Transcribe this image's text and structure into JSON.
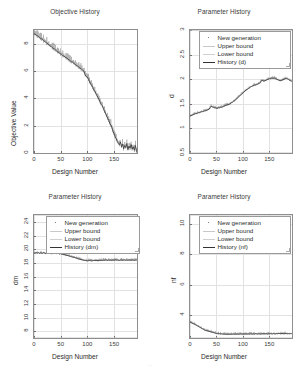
{
  "figure": {
    "width": 299,
    "height": 369,
    "background": "#ffffff",
    "footer_mark": ".."
  },
  "legend_common": {
    "new_generation": "New generation",
    "upper_bound": "Upper bound",
    "lower_bound": "Lower bound"
  },
  "colors": {
    "history_line": "#333333",
    "bound_line": "#c8c8c8",
    "marker": "#555555",
    "grid": "#e2e2e2",
    "axis": "#8e8e8e",
    "text": "#2b2b2b"
  },
  "chart_data": [
    {
      "id": "objective-history",
      "type": "line",
      "title": "Objective History",
      "xlabel": "Design Number",
      "ylabel": "Objective Value",
      "xlim": [
        0,
        193
      ],
      "ylim": [
        0,
        9
      ],
      "xticks": [
        0,
        50,
        100,
        150
      ],
      "yticks": [
        0,
        2,
        4,
        6,
        8
      ],
      "grid": true,
      "legend": null,
      "series": [
        {
          "name": "Objective Value",
          "x": [
            0,
            2,
            4,
            6,
            8,
            10,
            12,
            14,
            16,
            18,
            20,
            22,
            24,
            26,
            28,
            30,
            32,
            34,
            36,
            38,
            40,
            42,
            44,
            46,
            48,
            50,
            52,
            54,
            56,
            58,
            60,
            62,
            64,
            66,
            68,
            70,
            72,
            74,
            76,
            78,
            80,
            82,
            84,
            86,
            88,
            90,
            92,
            94,
            96,
            98,
            100,
            102,
            104,
            106,
            108,
            110,
            112,
            114,
            116,
            118,
            120,
            122,
            124,
            126,
            128,
            130,
            132,
            134,
            136,
            138,
            140,
            142,
            144,
            146,
            148,
            150,
            152,
            154,
            156,
            158,
            160,
            162,
            164,
            166,
            168,
            170,
            172,
            174,
            176,
            178,
            180,
            182,
            184,
            186,
            188,
            190,
            192
          ],
          "values": [
            8.72,
            8.7,
            8.64,
            8.58,
            8.55,
            8.46,
            8.4,
            8.36,
            8.3,
            8.22,
            8.18,
            8.1,
            8.05,
            7.98,
            7.92,
            7.84,
            7.8,
            7.72,
            7.66,
            7.62,
            7.55,
            7.48,
            7.4,
            7.38,
            7.3,
            7.25,
            7.2,
            7.12,
            7.1,
            7.02,
            6.98,
            6.94,
            6.88,
            6.8,
            6.74,
            6.68,
            6.65,
            6.58,
            6.52,
            6.46,
            6.4,
            6.34,
            6.28,
            6.22,
            6.18,
            6.1,
            6.02,
            5.95,
            5.7,
            5.6,
            5.55,
            5.4,
            5.22,
            5.05,
            4.98,
            4.8,
            4.62,
            4.52,
            4.35,
            4.2,
            4.05,
            3.9,
            3.72,
            3.55,
            3.45,
            3.25,
            3.05,
            2.92,
            2.7,
            2.55,
            2.38,
            2.18,
            2.05,
            1.85,
            1.6,
            1.4,
            1.2,
            1.05,
            0.85,
            0.7,
            0.6,
            0.8,
            0.45,
            0.65,
            0.3,
            0.55,
            0.4,
            0.7,
            0.25,
            0.5,
            0.35,
            0.62,
            0.28,
            0.45,
            0.2,
            0.55,
            0.1
          ]
        }
      ]
    },
    {
      "id": "parameter-history-d",
      "type": "line",
      "title": "Parameter History",
      "xlabel": "Design Number",
      "ylabel": "d",
      "xlim": [
        0,
        193
      ],
      "ylim": [
        0.5,
        3
      ],
      "xticks": [
        0,
        50,
        100,
        150
      ],
      "yticks": [
        0.5,
        1,
        1.5,
        2,
        2.5,
        3
      ],
      "grid": true,
      "legend": {
        "position": "top-right",
        "entries": [
          "New generation",
          "Upper bound",
          "Lower bound",
          "History (d)"
        ]
      },
      "series": [
        {
          "name": "History (d)",
          "x": [
            0,
            2,
            4,
            6,
            8,
            10,
            12,
            14,
            16,
            18,
            20,
            22,
            24,
            26,
            28,
            30,
            32,
            34,
            36,
            38,
            40,
            42,
            44,
            46,
            48,
            50,
            52,
            54,
            56,
            58,
            60,
            62,
            64,
            66,
            68,
            70,
            72,
            74,
            76,
            78,
            80,
            82,
            84,
            86,
            88,
            90,
            92,
            94,
            96,
            98,
            100,
            102,
            104,
            106,
            108,
            110,
            112,
            114,
            116,
            118,
            120,
            122,
            124,
            126,
            128,
            130,
            132,
            134,
            136,
            138,
            140,
            142,
            144,
            146,
            148,
            150,
            152,
            154,
            156,
            158,
            160,
            162,
            164,
            166,
            168,
            170,
            172,
            174,
            176,
            178,
            180,
            182,
            184,
            186,
            188,
            190,
            192
          ],
          "values": [
            1.25,
            1.26,
            1.27,
            1.28,
            1.29,
            1.3,
            1.3,
            1.31,
            1.32,
            1.32,
            1.33,
            1.34,
            1.34,
            1.35,
            1.36,
            1.36,
            1.37,
            1.38,
            1.39,
            1.42,
            1.45,
            1.44,
            1.43,
            1.42,
            1.42,
            1.41,
            1.41,
            1.42,
            1.42,
            1.43,
            1.43,
            1.44,
            1.45,
            1.46,
            1.47,
            1.48,
            1.48,
            1.49,
            1.5,
            1.52,
            1.53,
            1.55,
            1.56,
            1.58,
            1.6,
            1.62,
            1.64,
            1.66,
            1.68,
            1.7,
            1.72,
            1.74,
            1.76,
            1.78,
            1.79,
            1.81,
            1.82,
            1.84,
            1.85,
            1.86,
            1.87,
            1.88,
            1.88,
            1.89,
            1.9,
            1.91,
            1.92,
            1.95,
            1.98,
            1.97,
            1.96,
            1.97,
            1.98,
            1.99,
            2.0,
            2.01,
            2.01,
            2.02,
            2.02,
            2.02,
            2.02,
            2.01,
            2.0,
            1.99,
            1.98,
            1.97,
            1.97,
            1.98,
            1.99,
            2.0,
            2.01,
            2.02,
            2.01,
            2.0,
            1.98,
            1.97,
            1.96
          ]
        }
      ],
      "bounds": {
        "upper": 3,
        "lower": 0.5
      }
    },
    {
      "id": "parameter-history-dm",
      "type": "line",
      "title": "Parameter History",
      "xlabel": "Design Number",
      "ylabel": "dm",
      "xlim": [
        0,
        193
      ],
      "ylim": [
        7,
        25
      ],
      "xticks": [
        0,
        50,
        100,
        150
      ],
      "yticks": [
        8,
        10,
        12,
        14,
        16,
        18,
        20,
        22,
        24
      ],
      "grid": true,
      "legend": {
        "position": "top-right",
        "entries": [
          "New generation",
          "Upper bound",
          "Lower bound",
          "History (dm)"
        ]
      },
      "series": [
        {
          "name": "History (dm)",
          "x": [
            0,
            2,
            4,
            6,
            8,
            10,
            12,
            14,
            16,
            18,
            20,
            22,
            24,
            26,
            28,
            30,
            32,
            34,
            36,
            38,
            40,
            42,
            44,
            46,
            48,
            50,
            52,
            54,
            56,
            58,
            60,
            62,
            64,
            66,
            68,
            70,
            72,
            74,
            76,
            78,
            80,
            82,
            84,
            86,
            88,
            90,
            92,
            94,
            96,
            98,
            100,
            102,
            104,
            106,
            108,
            110,
            112,
            114,
            116,
            118,
            120,
            122,
            124,
            126,
            128,
            130,
            132,
            134,
            136,
            138,
            140,
            142,
            144,
            146,
            148,
            150,
            152,
            154,
            156,
            158,
            160,
            162,
            164,
            166,
            168,
            170,
            172,
            174,
            176,
            178,
            180,
            182,
            184,
            186,
            188,
            190,
            192
          ],
          "values": [
            19.45,
            19.4,
            19.48,
            19.42,
            19.5,
            19.38,
            19.45,
            19.42,
            19.4,
            19.48,
            19.42,
            19.35,
            19.5,
            19.4,
            19.38,
            19.45,
            19.3,
            19.42,
            19.95,
            19.5,
            19.4,
            19.35,
            19.42,
            19.38,
            19.3,
            19.35,
            19.28,
            19.25,
            19.2,
            19.18,
            19.12,
            19.1,
            19.05,
            19.0,
            18.95,
            18.9,
            18.85,
            18.8,
            18.78,
            18.72,
            18.68,
            18.62,
            18.58,
            18.52,
            18.48,
            18.45,
            18.4,
            18.38,
            18.35,
            18.32,
            18.3,
            18.32,
            18.35,
            18.33,
            18.3,
            18.32,
            18.34,
            18.36,
            18.33,
            18.35,
            18.3,
            18.36,
            18.34,
            18.38,
            18.35,
            18.4,
            18.38,
            18.42,
            18.4,
            18.36,
            18.42,
            18.38,
            18.4,
            18.36,
            18.42,
            18.38,
            18.45,
            18.4,
            18.42,
            18.38,
            18.35,
            18.4,
            18.42,
            18.38,
            18.4,
            18.42,
            18.38,
            18.41,
            18.39,
            18.42,
            18.4,
            18.38,
            18.42,
            18.4,
            18.38,
            18.41,
            18.4
          ]
        }
      ],
      "bounds": {
        "upper": 25,
        "lower": 7
      }
    },
    {
      "id": "parameter-history-nf",
      "type": "line",
      "title": "Parameter History",
      "xlabel": "Design Number",
      "ylabel": "nf",
      "xlim": [
        0,
        193
      ],
      "ylim": [
        2.5,
        10.6
      ],
      "xticks": [
        0,
        50,
        100,
        150
      ],
      "yticks": [
        4,
        6,
        8,
        10
      ],
      "grid": true,
      "legend": {
        "position": "top-right",
        "entries": [
          "New generation",
          "Upper bound",
          "Lower bound",
          "History (nf)"
        ]
      },
      "series": [
        {
          "name": "History (nf)",
          "x": [
            0,
            2,
            4,
            6,
            8,
            10,
            12,
            14,
            16,
            18,
            20,
            22,
            24,
            26,
            28,
            30,
            32,
            34,
            36,
            38,
            40,
            42,
            44,
            46,
            48,
            50,
            52,
            54,
            56,
            58,
            60,
            62,
            64,
            66,
            68,
            70,
            72,
            74,
            76,
            78,
            80,
            82,
            84,
            86,
            88,
            90,
            92,
            94,
            96,
            98,
            100,
            102,
            104,
            106,
            108,
            110,
            112,
            114,
            116,
            118,
            120,
            122,
            124,
            126,
            128,
            130,
            132,
            134,
            136,
            138,
            140,
            142,
            144,
            146,
            148,
            150,
            152,
            154,
            156,
            158,
            160,
            162,
            164,
            166,
            168,
            170,
            172,
            174,
            176,
            178,
            180,
            182,
            184,
            186,
            188,
            190,
            192
          ],
          "values": [
            3.55,
            3.52,
            3.48,
            3.45,
            3.42,
            3.38,
            3.34,
            3.3,
            3.26,
            3.22,
            3.18,
            3.14,
            3.1,
            3.06,
            3.02,
            3.0,
            2.98,
            2.96,
            2.94,
            2.92,
            2.9,
            2.88,
            2.86,
            2.84,
            2.82,
            2.8,
            2.79,
            2.78,
            2.78,
            2.77,
            2.77,
            2.76,
            2.76,
            2.76,
            2.75,
            2.75,
            2.75,
            2.75,
            2.75,
            2.75,
            2.75,
            2.76,
            2.75,
            2.76,
            2.75,
            2.76,
            2.75,
            2.76,
            2.77,
            2.76,
            2.75,
            2.77,
            2.76,
            2.77,
            2.76,
            2.77,
            2.76,
            2.78,
            2.77,
            2.76,
            2.77,
            2.76,
            2.78,
            2.77,
            2.76,
            2.78,
            2.77,
            2.76,
            2.78,
            2.77,
            2.78,
            2.77,
            2.78,
            2.77,
            2.78,
            2.77,
            2.79,
            2.78,
            2.77,
            2.79,
            2.78,
            2.77,
            2.79,
            2.78,
            2.8,
            2.79,
            2.78,
            2.8,
            2.79,
            2.78,
            2.8,
            2.79,
            2.78,
            2.79,
            2.78,
            2.79,
            2.78
          ]
        }
      ],
      "bounds": {
        "upper": 10.6,
        "lower": 2.5
      }
    }
  ]
}
